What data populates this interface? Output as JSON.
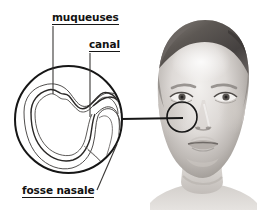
{
  "figure": {
    "background_color": "#ffffff",
    "line_color": "#161616",
    "text_color": "#121212",
    "width": 273,
    "height": 210
  },
  "labels": {
    "muqueuses": "muqueuses",
    "canal": "canal",
    "fosse_nasale": "fosse nasale"
  },
  "callout": {
    "magnifier_circle": {
      "cx": 68.5,
      "cy": 119.5,
      "r": 53.5
    },
    "nose_circle": {
      "cx": 182,
      "cy": 117,
      "r": 15
    },
    "connector_line": {
      "x1": 122,
      "y1": 119,
      "x2": 182,
      "y2": 118
    }
  },
  "leader_lines": {
    "muqueuses": {
      "x1": 53,
      "y1": 26,
      "x2": 53,
      "y2": 94
    },
    "canal": {
      "x1": 90,
      "y1": 53,
      "x2": 90,
      "y2": 117
    },
    "fosse_nasale": {
      "x1": 97,
      "y1": 191,
      "x2": 116,
      "y2": 146
    }
  },
  "photo": {
    "subject": "portrait de femme en niveaux de gris, cheveux courts, vue de face",
    "region": {
      "x": 152,
      "y": 14,
      "width": 112,
      "height": 196
    }
  },
  "anatomy": {
    "parts": [
      {
        "name": "muqueuses",
        "description": "double contour ondule de la paroi interne"
      },
      {
        "name": "canal",
        "description": "conduit etroit en S sur le cote droit"
      },
      {
        "name": "fosse nasale",
        "description": "cavite principale fermee"
      }
    ]
  }
}
